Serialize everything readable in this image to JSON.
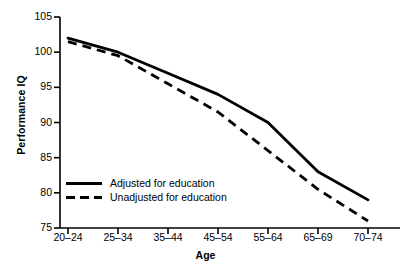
{
  "chart_data": {
    "type": "line",
    "title": "",
    "xlabel": "Age",
    "ylabel": "Performance IQ",
    "categories": [
      "20–24",
      "25–34",
      "35–44",
      "45–54",
      "55–64",
      "65–69",
      "70–74"
    ],
    "ylim": [
      75,
      105
    ],
    "yticks": [
      75,
      80,
      85,
      90,
      95,
      100,
      105
    ],
    "grid": false,
    "legend_position": "lower-left-inside",
    "series": [
      {
        "name": "Adjusted for education",
        "style": "solid",
        "color": "#000000",
        "values": [
          102,
          100,
          97,
          94,
          90,
          83,
          79
        ]
      },
      {
        "name": "Unadjusted for education",
        "style": "dashed",
        "color": "#000000",
        "values": [
          101.5,
          99.5,
          95.5,
          91.5,
          86,
          80.5,
          76
        ]
      }
    ]
  },
  "axis": {
    "y_title": "Performance IQ",
    "x_title": "Age",
    "y_tick_labels": [
      "105",
      "100",
      "95",
      "90",
      "85",
      "80",
      "75"
    ],
    "x_tick_labels": [
      "20–24",
      "25–34",
      "35–44",
      "45–54",
      "55–64",
      "65–69",
      "70–74"
    ]
  },
  "legend": {
    "items": [
      {
        "label": "Adjusted for education",
        "style": "solid"
      },
      {
        "label": "Unadjusted for education",
        "style": "dashed"
      }
    ]
  }
}
